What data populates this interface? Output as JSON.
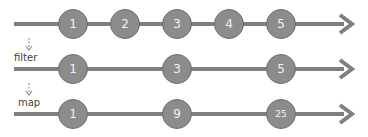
{
  "colors": {
    "line": "#7f7f7f",
    "marble_fill": "#8c8c8c",
    "marble_text": "#f2f2f2",
    "label": "#404040"
  },
  "timelines": [
    {
      "name": "source",
      "y": 7,
      "marbles": [
        {
          "label": "1",
          "x": 73
        },
        {
          "label": "2",
          "x": 125
        },
        {
          "label": "3",
          "x": 177
        },
        {
          "label": "4",
          "x": 229
        },
        {
          "label": "5",
          "x": 281
        }
      ]
    },
    {
      "name": "filtered",
      "y": 52,
      "operator": "filter",
      "marbles": [
        {
          "label": "1",
          "x": 73
        },
        {
          "label": "3",
          "x": 177
        },
        {
          "label": "5",
          "x": 281
        }
      ]
    },
    {
      "name": "mapped",
      "y": 97,
      "operator": "map",
      "marbles": [
        {
          "label": "1",
          "x": 73
        },
        {
          "label": "9",
          "x": 177
        },
        {
          "label": "25",
          "x": 281
        }
      ]
    }
  ],
  "operators": {
    "filter": "filter",
    "map": "map"
  }
}
